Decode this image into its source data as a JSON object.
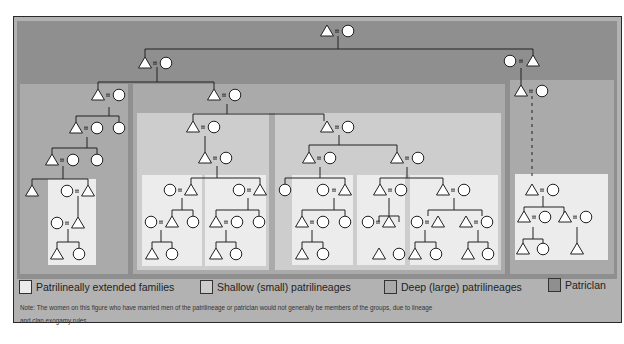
{
  "colors": {
    "patriclan": "#8f8f8f",
    "deep": "#aaaaaa",
    "shallow": "#cdcdcd",
    "extended": "#ececec",
    "frame_bg": "#b3b3b3",
    "line": "#222222",
    "symbol_fill": "#ffffff"
  },
  "legend": [
    {
      "label": "Patrilineally extended families",
      "color": "#ececec"
    },
    {
      "label": "Shallow (small) patrilineages",
      "color": "#cdcdcd"
    },
    {
      "label": "Deep (large) patrilineages",
      "color": "#aaaaaa"
    },
    {
      "label": "Patriclan",
      "color": "#8f8f8f"
    }
  ],
  "note": {
    "line1": "Note:  The women on this figure who have married men of the patrilineage or patriclan would not generally be members of the groups, due to lineage",
    "line2": "and clan exogamy rules."
  },
  "symbols": {
    "male": "triangle",
    "female": "circle",
    "marriage": "="
  }
}
